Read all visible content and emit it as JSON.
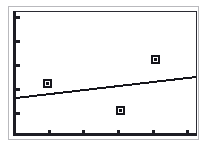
{
  "chart_data": {
    "type": "scatter",
    "title": "",
    "subtitle": "",
    "xlabel": "",
    "ylabel": "",
    "xlim": [
      0,
      5
    ],
    "ylim": [
      0,
      5
    ],
    "grid": false,
    "legend": null,
    "legend_position": "none",
    "x_tick_labels": [
      "",
      "",
      "",
      "",
      ""
    ],
    "y_tick_labels": [
      "",
      "",
      "",
      "",
      ""
    ],
    "x_tick_values": [
      1,
      2,
      3,
      4,
      5
    ],
    "y_tick_values": [
      1,
      2,
      3,
      4,
      5
    ],
    "series": [
      {
        "name": "observations",
        "type": "scatter",
        "marker": "square",
        "color": "#15151b",
        "points": [
          {
            "x": 1.0,
            "y": 2.1
          },
          {
            "x": 3.0,
            "y": 1.0
          },
          {
            "x": 4.0,
            "y": 3.1
          }
        ]
      },
      {
        "name": "trend-line",
        "type": "line",
        "color": "#15151b",
        "points": [
          {
            "x": 0.0,
            "y": 1.5
          },
          {
            "x": 5.0,
            "y": 2.4
          }
        ]
      }
    ],
    "annotations": []
  },
  "figure": {
    "background_color": "#ffffff",
    "axis_color": "#1d1d24",
    "frame_color": "#2b2b33",
    "outer_frame_color": "#b9b9bd",
    "marker_fill": "#ffffff",
    "marker_edge": "#15151b",
    "line_color": "#15151b"
  },
  "geometry": {
    "y_ticks_px": [
      16,
      40,
      64,
      88,
      112
    ],
    "x_ticks_px": [
      48,
      82,
      117,
      152,
      186
    ],
    "markers_px": [
      {
        "left": 43,
        "top": 79
      },
      {
        "left": 116,
        "top": 106
      },
      {
        "left": 151,
        "top": 55
      }
    ],
    "trend_line_px": {
      "x1": 16,
      "y1": 98,
      "x2": 196,
      "y2": 77
    }
  }
}
